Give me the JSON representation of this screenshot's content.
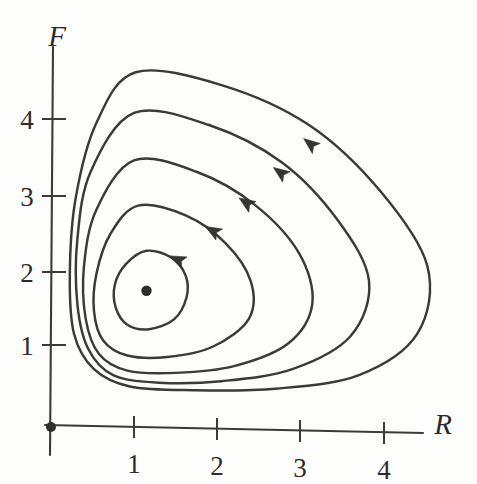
{
  "figure": {
    "kind": "phase-portrait",
    "background_color": "#fdfdfb",
    "curve_color": "#3a3a3a",
    "axis_color": "#3b3b3b"
  },
  "chart_data": {
    "type": "line",
    "title": "",
    "xlabel": "R",
    "ylabel": "F",
    "xlim": [
      0,
      4.9
    ],
    "ylim": [
      0,
      5.0
    ],
    "grid": false,
    "legend": "none",
    "xticks": [
      {
        "label": "1",
        "value": 1
      },
      {
        "label": "2",
        "value": 2
      },
      {
        "label": "3",
        "value": 3
      },
      {
        "label": "4",
        "value": 4
      }
    ],
    "yticks": [
      {
        "label": "1",
        "value": 1
      },
      {
        "label": "2",
        "value": 2
      },
      {
        "label": "3",
        "value": 3
      },
      {
        "label": "4",
        "value": 4
      }
    ],
    "equilibrium_points": [
      {
        "name": "origin",
        "x": 0,
        "y": 0,
        "marker": "filled-dot"
      },
      {
        "name": "center",
        "x": 1.15,
        "y": 1.72,
        "marker": "filled-dot"
      }
    ],
    "series": [
      {
        "name": "orbit-1-innermost",
        "direction": "counterclockwise",
        "r_range": [
          0.75,
          1.65
        ],
        "f_range": [
          1.2,
          2.25
        ],
        "points": [
          [
            1.15,
            2.25
          ],
          [
            1.45,
            2.16
          ],
          [
            1.62,
            1.92
          ],
          [
            1.63,
            1.63
          ],
          [
            1.48,
            1.34
          ],
          [
            1.18,
            1.21
          ],
          [
            0.92,
            1.27
          ],
          [
            0.78,
            1.5
          ],
          [
            0.77,
            1.8
          ],
          [
            0.9,
            2.07
          ],
          [
            1.15,
            2.25
          ]
        ]
      },
      {
        "name": "orbit-2",
        "direction": "counterclockwise",
        "r_range": [
          0.5,
          2.45
        ],
        "f_range": [
          0.8,
          2.85
        ],
        "points": [
          [
            1.05,
            2.85
          ],
          [
            1.62,
            2.72
          ],
          [
            2.1,
            2.35
          ],
          [
            2.4,
            1.85
          ],
          [
            2.38,
            1.35
          ],
          [
            1.95,
            0.98
          ],
          [
            1.4,
            0.84
          ],
          [
            0.92,
            0.86
          ],
          [
            0.63,
            1.06
          ],
          [
            0.52,
            1.45
          ],
          [
            0.55,
            1.95
          ],
          [
            0.72,
            2.48
          ],
          [
            1.05,
            2.85
          ]
        ]
      },
      {
        "name": "orbit-3",
        "direction": "counterclockwise",
        "r_range": [
          0.38,
          3.15
        ],
        "f_range": [
          0.62,
          3.45
        ],
        "points": [
          [
            1.0,
            3.45
          ],
          [
            1.75,
            3.3
          ],
          [
            2.45,
            2.86
          ],
          [
            2.98,
            2.22
          ],
          [
            3.14,
            1.55
          ],
          [
            2.85,
            1.02
          ],
          [
            2.2,
            0.72
          ],
          [
            1.5,
            0.63
          ],
          [
            0.92,
            0.66
          ],
          [
            0.58,
            0.88
          ],
          [
            0.42,
            1.35
          ],
          [
            0.4,
            2.05
          ],
          [
            0.55,
            2.8
          ],
          [
            1.0,
            3.45
          ]
        ]
      },
      {
        "name": "orbit-4",
        "direction": "counterclockwise",
        "r_range": [
          0.28,
          3.85
        ],
        "f_range": [
          0.5,
          4.08
        ],
        "points": [
          [
            1.0,
            4.08
          ],
          [
            1.9,
            3.92
          ],
          [
            2.78,
            3.42
          ],
          [
            3.45,
            2.65
          ],
          [
            3.82,
            1.85
          ],
          [
            3.6,
            1.12
          ],
          [
            2.9,
            0.68
          ],
          [
            2.05,
            0.52
          ],
          [
            1.3,
            0.5
          ],
          [
            0.75,
            0.6
          ],
          [
            0.45,
            0.95
          ],
          [
            0.32,
            1.55
          ],
          [
            0.32,
            2.4
          ],
          [
            0.48,
            3.3
          ],
          [
            1.0,
            4.08
          ]
        ]
      },
      {
        "name": "orbit-5-outermost",
        "direction": "counterclockwise",
        "r_range": [
          0.2,
          4.55
        ],
        "f_range": [
          0.4,
          4.62
        ],
        "points": [
          [
            1.02,
            4.62
          ],
          [
            2.05,
            4.45
          ],
          [
            3.1,
            3.92
          ],
          [
            3.95,
            3.05
          ],
          [
            4.52,
            2.05
          ],
          [
            4.4,
            1.15
          ],
          [
            3.7,
            0.6
          ],
          [
            2.7,
            0.42
          ],
          [
            1.7,
            0.4
          ],
          [
            0.95,
            0.45
          ],
          [
            0.52,
            0.68
          ],
          [
            0.28,
            1.15
          ],
          [
            0.23,
            1.95
          ],
          [
            0.3,
            2.95
          ],
          [
            0.55,
            3.95
          ],
          [
            1.02,
            4.62
          ]
        ]
      }
    ],
    "flow_arrows": [
      {
        "on_series": "orbit-1-innermost",
        "x": 1.55,
        "y": 2.12,
        "angle_deg": 205
      },
      {
        "on_series": "orbit-2",
        "x": 1.97,
        "y": 2.5,
        "angle_deg": 210
      },
      {
        "on_series": "orbit-3",
        "x": 2.37,
        "y": 2.87,
        "angle_deg": 214
      },
      {
        "on_series": "orbit-4",
        "x": 2.78,
        "y": 3.27,
        "angle_deg": 216
      },
      {
        "on_series": "orbit-5-outermost",
        "x": 3.14,
        "y": 3.65,
        "angle_deg": 218
      }
    ]
  }
}
